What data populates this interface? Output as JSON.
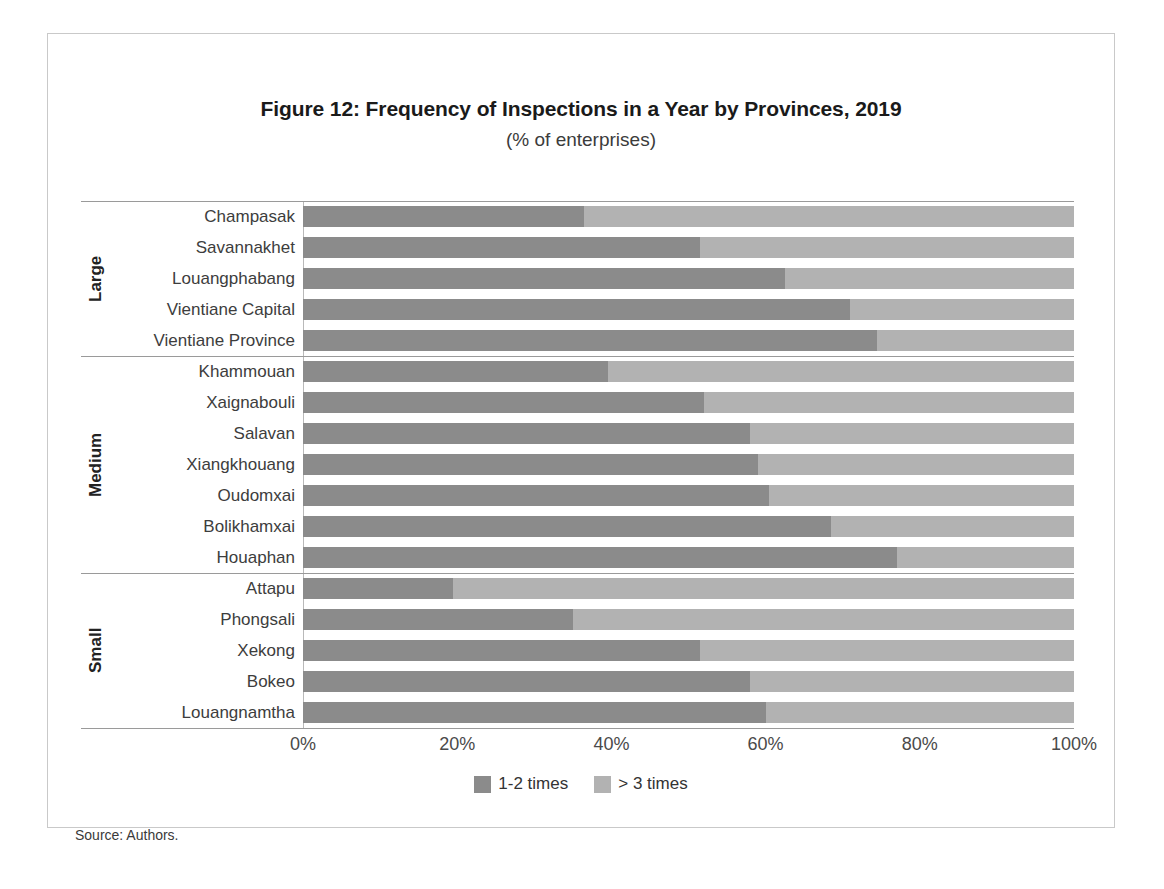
{
  "figure": {
    "title": "Figure 12: Frequency of Inspections in a Year by Provinces, 2019",
    "subtitle": "(% of enterprises)",
    "source": "Source: Authors."
  },
  "legend": {
    "items": [
      {
        "label": "1-2 times",
        "color": "#8b8b8b"
      },
      {
        "label": "> 3 times",
        "color": "#b2b2b2"
      }
    ]
  },
  "axis": {
    "ticks": [
      "0%",
      "20%",
      "40%",
      "60%",
      "80%",
      "100%"
    ],
    "tick_values": [
      0,
      20,
      40,
      60,
      80,
      100
    ]
  },
  "groups": [
    {
      "label": "Large",
      "start": 0,
      "count": 5
    },
    {
      "label": "Medium",
      "start": 5,
      "count": 7
    },
    {
      "label": "Small",
      "start": 12,
      "count": 5
    }
  ],
  "chart_data": {
    "type": "bar",
    "orientation": "horizontal",
    "stacked": true,
    "normalized_percent": true,
    "title": "Figure 12: Frequency of Inspections in a Year by Provinces, 2019",
    "subtitle": "(% of enterprises)",
    "xlabel": "",
    "ylabel": "",
    "xlim": [
      0,
      100
    ],
    "grid": false,
    "legend_position": "bottom",
    "categories": [
      "Champasak",
      "Savannakhet",
      "Louangphabang",
      "Vientiane Capital",
      "Vientiane Province",
      "Khammouan",
      "Xaignabouli",
      "Salavan",
      "Xiangkhouang",
      "Oudomxai",
      "Bolikhamxai",
      "Houaphan",
      "Attapu",
      "Phongsali",
      "Xekong",
      "Bokeo",
      "Louangnamtha"
    ],
    "category_groups": [
      "Large",
      "Large",
      "Large",
      "Large",
      "Large",
      "Medium",
      "Medium",
      "Medium",
      "Medium",
      "Medium",
      "Medium",
      "Medium",
      "Small",
      "Small",
      "Small",
      "Small",
      "Small"
    ],
    "series": [
      {
        "name": "1-2 times",
        "color": "#8b8b8b",
        "values": [
          36.5,
          51.5,
          62.5,
          71.0,
          74.5,
          39.5,
          52.0,
          58.0,
          59.0,
          60.5,
          68.5,
          77.0,
          19.5,
          35.0,
          51.5,
          58.0,
          60.0
        ]
      },
      {
        "name": "> 3 times",
        "color": "#b2b2b2",
        "values": [
          63.5,
          48.5,
          37.5,
          29.0,
          25.5,
          60.5,
          48.0,
          42.0,
          41.0,
          39.5,
          31.5,
          23.0,
          80.5,
          65.0,
          48.5,
          42.0,
          40.0
        ]
      }
    ]
  }
}
